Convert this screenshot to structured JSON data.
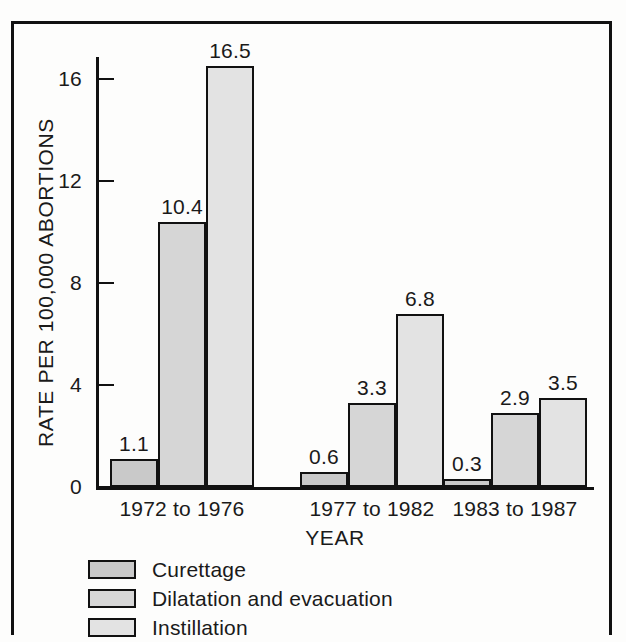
{
  "chart_data": {
    "type": "bar",
    "title": "",
    "subtitle": "",
    "xlabel": "YEAR",
    "ylabel": "RATE PER 100,000 ABORTIONS",
    "categories": [
      "1972 to 1976",
      "1977 to 1982",
      "1983 to 1987"
    ],
    "series": [
      {
        "name": "Curettage",
        "values": [
          1.1,
          0.6,
          0.3
        ],
        "color": "#c9c9c9"
      },
      {
        "name": "Dilatation and evacuation",
        "values": [
          10.4,
          3.3,
          2.9
        ],
        "color": "#d6d6d6"
      },
      {
        "name": "Instillation",
        "values": [
          16.5,
          6.8,
          3.5
        ],
        "color": "#e3e3e3"
      }
    ],
    "value_labels": [
      [
        "1.1",
        "10.4",
        "16.5"
      ],
      [
        "0.6",
        "3.3",
        "6.8"
      ],
      [
        "0.3",
        "2.9",
        "3.5"
      ]
    ],
    "ylim": [
      0,
      17.3
    ],
    "yticks": [
      0,
      4,
      8,
      12,
      16
    ],
    "ytick_labels": [
      "0",
      "4",
      "8",
      "12",
      "16"
    ],
    "grid": false,
    "legend_position": "below",
    "bar_border_color": "#111111",
    "axis_color": "#111111",
    "background": "#fdfdfc"
  },
  "legend": {
    "items": [
      {
        "label": "Curettage",
        "color": "#c9c9c9"
      },
      {
        "label": "Dilatation and evacuation",
        "color": "#d6d6d6"
      },
      {
        "label": "Instillation",
        "color": "#e3e3e3"
      }
    ]
  }
}
